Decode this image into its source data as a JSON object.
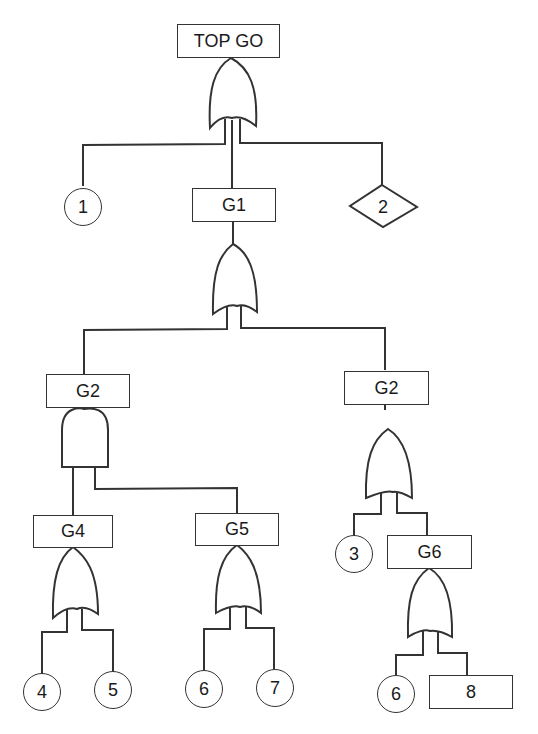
{
  "diagram": {
    "type": "fault-tree",
    "stroke_color": "#333333",
    "top_event": "TOP GO",
    "nodes": {
      "top": {
        "label": "TOP GO",
        "shape": "rectangle",
        "gate": "OR"
      },
      "basic1": {
        "label": "1",
        "shape": "circle"
      },
      "g1": {
        "label": "G1",
        "shape": "rectangle",
        "gate": "OR"
      },
      "undeveloped2": {
        "label": "2",
        "shape": "diamond"
      },
      "g2_left": {
        "label": "G2",
        "shape": "rectangle",
        "gate": "AND"
      },
      "g2_right": {
        "label": "G2",
        "shape": "rectangle",
        "gate": "OR"
      },
      "g4": {
        "label": "G4",
        "shape": "rectangle",
        "gate": "OR"
      },
      "g5": {
        "label": "G5",
        "shape": "rectangle",
        "gate": "OR"
      },
      "basic3": {
        "label": "3",
        "shape": "circle"
      },
      "g6": {
        "label": "G6",
        "shape": "rectangle",
        "gate": "OR"
      },
      "basic4": {
        "label": "4",
        "shape": "circle"
      },
      "basic5": {
        "label": "5",
        "shape": "circle"
      },
      "basic6a": {
        "label": "6",
        "shape": "circle"
      },
      "basic7": {
        "label": "7",
        "shape": "circle"
      },
      "basic6b": {
        "label": "6",
        "shape": "circle"
      },
      "event8": {
        "label": "8",
        "shape": "rectangle"
      }
    },
    "edges": [
      [
        "TOP GO",
        "1"
      ],
      [
        "TOP GO",
        "G1"
      ],
      [
        "TOP GO",
        "2"
      ],
      [
        "G1",
        "G2 (left)"
      ],
      [
        "G1",
        "G2 (right)"
      ],
      [
        "G2 (left)",
        "G4"
      ],
      [
        "G2 (left)",
        "G5"
      ],
      [
        "G4",
        "4"
      ],
      [
        "G4",
        "5"
      ],
      [
        "G5",
        "6"
      ],
      [
        "G5",
        "7"
      ],
      [
        "G2 (right)",
        "3"
      ],
      [
        "G2 (right)",
        "G6"
      ],
      [
        "G6",
        "6"
      ],
      [
        "G6",
        "8"
      ]
    ]
  }
}
